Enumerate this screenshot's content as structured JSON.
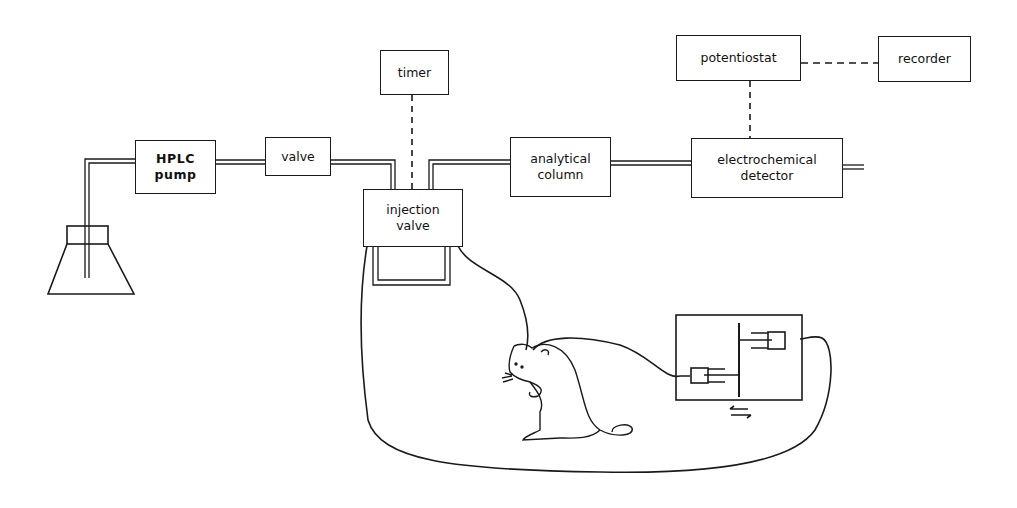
{
  "diagram": {
    "title": "",
    "nodes": [
      {
        "id": "hplc_pump",
        "label": "HPLC\npump"
      },
      {
        "id": "valve",
        "label": "valve"
      },
      {
        "id": "timer",
        "label": "timer"
      },
      {
        "id": "injection_valve",
        "label": "injection\nvalve"
      },
      {
        "id": "analytical_column",
        "label": "analytical\ncolumn"
      },
      {
        "id": "potentiostat",
        "label": "potentiostat"
      },
      {
        "id": "recorder",
        "label": "recorder"
      },
      {
        "id": "electrochemical_detector",
        "label": "electrochemical\ndetector"
      }
    ],
    "edges": [
      {
        "from": "solvent_reservoir",
        "to": "hplc_pump",
        "style": "tube"
      },
      {
        "from": "hplc_pump",
        "to": "valve",
        "style": "tube"
      },
      {
        "from": "valve",
        "to": "injection_valve",
        "style": "tube"
      },
      {
        "from": "timer",
        "to": "injection_valve",
        "style": "dashed"
      },
      {
        "from": "injection_valve",
        "to": "analytical_column",
        "style": "tube"
      },
      {
        "from": "analytical_column",
        "to": "electrochemical_detector",
        "style": "tube"
      },
      {
        "from": "potentiostat",
        "to": "electrochemical_detector",
        "style": "dashed"
      },
      {
        "from": "potentiostat",
        "to": "recorder",
        "style": "dashed"
      },
      {
        "from": "injection_valve",
        "to": "rat_probe",
        "style": "line"
      },
      {
        "from": "rat_probe",
        "to": "syringe_pump",
        "style": "line"
      },
      {
        "from": "syringe_pump",
        "to": "injection_valve",
        "style": "line"
      }
    ],
    "unlabeled_elements": [
      "solvent-reservoir-flask",
      "sample-loop",
      "rat",
      "syringe-pump",
      "bidirectional-arrows"
    ]
  }
}
